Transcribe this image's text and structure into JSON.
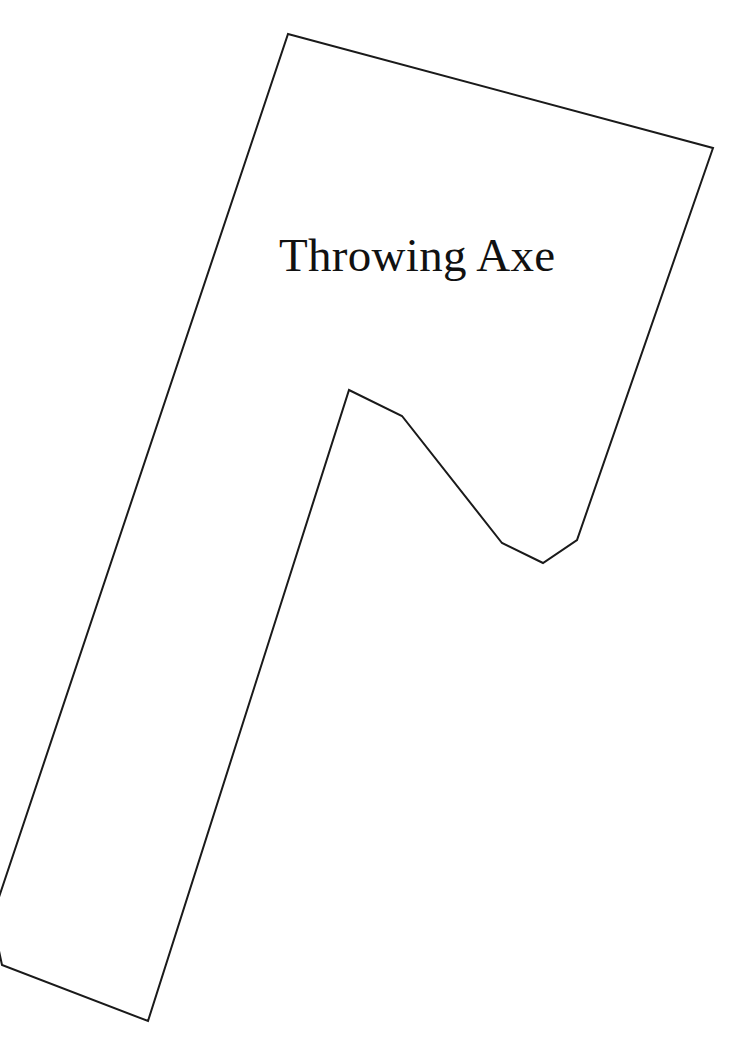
{
  "page": {
    "width": 756,
    "height": 1054,
    "background_color": "#ffffff"
  },
  "diagram": {
    "title": "Throwing Axe",
    "title_position": {
      "x": 279,
      "y": 229
    },
    "title_font_size_px": 47,
    "title_color": "#111111",
    "shape_name": "throwing-axe-outline",
    "stroke_color": "#1a1a1a",
    "stroke_width_px": 2,
    "fill_color": "#ffffff",
    "outline_points": "288,34 713,148 577,540 543,563 502,543 402,416 349,390 148,1021 2,965 -8,918",
    "vertices": [
      {
        "name": "head-top-left",
        "x": 288,
        "y": 34
      },
      {
        "name": "head-top-right",
        "x": 713,
        "y": 148
      },
      {
        "name": "head-bottom-right",
        "x": 577,
        "y": 540
      },
      {
        "name": "notch-bottom",
        "x": 543,
        "y": 563
      },
      {
        "name": "notch-left-bottom",
        "x": 502,
        "y": 543
      },
      {
        "name": "notch-mid",
        "x": 402,
        "y": 416
      },
      {
        "name": "notch-peak",
        "x": 349,
        "y": 390
      },
      {
        "name": "handle-bottom-right",
        "x": 148,
        "y": 1021
      },
      {
        "name": "handle-bottom-left",
        "x": 2,
        "y": 965
      },
      {
        "name": "handle-left-clipped",
        "x": -8,
        "y": 918
      }
    ]
  }
}
